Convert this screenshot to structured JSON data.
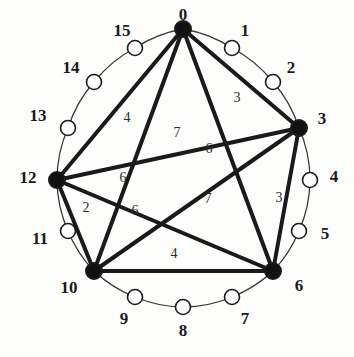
{
  "figure": {
    "colors": {
      "background": "#fdfdfb",
      "edge": "#1a1a1a",
      "arc": "#3a3a3a",
      "filled_node_fill": "#111111",
      "open_node_fill": "#ffffff",
      "node_stroke": "#1a1a1a",
      "label_text": "#1a1a1a",
      "edge_label_text": "#2b2b2b"
    },
    "geometry": {
      "center_x": 183,
      "center_y": 157,
      "node_radius": 128,
      "label_radius": 163
    }
  },
  "chart_data": {
    "type": "diagram",
    "title": "",
    "node_count": 16,
    "nodes": [
      {
        "id": "0",
        "label": "0",
        "x": 183,
        "y": 29,
        "type": "filled",
        "label_x": 183,
        "label_y": 14
      },
      {
        "id": "1",
        "label": "1",
        "x": 232,
        "y": 48,
        "type": "open",
        "label_x": 245,
        "label_y": 30
      },
      {
        "id": "2",
        "label": "2",
        "x": 273,
        "y": 82,
        "type": "open",
        "label_x": 291,
        "label_y": 67
      },
      {
        "id": "3",
        "label": "3",
        "x": 299,
        "y": 128,
        "type": "filled",
        "label_x": 322,
        "label_y": 118
      },
      {
        "id": "4",
        "label": "4",
        "x": 310,
        "y": 180,
        "type": "open",
        "label_x": 334,
        "label_y": 176
      },
      {
        "id": "5",
        "label": "5",
        "x": 299,
        "y": 231,
        "type": "open",
        "label_x": 325,
        "label_y": 233
      },
      {
        "id": "6",
        "label": "6",
        "x": 273,
        "y": 271,
        "type": "filled",
        "label_x": 299,
        "label_y": 285
      },
      {
        "id": "7",
        "label": "7",
        "x": 232,
        "y": 297,
        "type": "open",
        "label_x": 245,
        "label_y": 318
      },
      {
        "id": "8",
        "label": "8",
        "x": 183,
        "y": 307,
        "type": "open",
        "label_x": 183,
        "label_y": 330
      },
      {
        "id": "9",
        "label": "9",
        "x": 135,
        "y": 297,
        "type": "open",
        "label_x": 124,
        "label_y": 318
      },
      {
        "id": "10",
        "label": "10",
        "x": 94,
        "y": 271,
        "type": "filled",
        "label_x": 69,
        "label_y": 287
      },
      {
        "id": "11",
        "label": "11",
        "x": 68,
        "y": 231,
        "type": "open",
        "label_x": 40,
        "label_y": 238
      },
      {
        "id": "12",
        "label": "12",
        "x": 57,
        "y": 180,
        "type": "filled",
        "label_x": 28,
        "label_y": 177
      },
      {
        "id": "13",
        "label": "13",
        "x": 68,
        "y": 128,
        "type": "open",
        "label_x": 38,
        "label_y": 115
      },
      {
        "id": "14",
        "label": "14",
        "x": 94,
        "y": 82,
        "type": "open",
        "label_x": 71,
        "label_y": 67
      },
      {
        "id": "15",
        "label": "15",
        "x": 135,
        "y": 48,
        "type": "open",
        "label_x": 122,
        "label_y": 30
      }
    ],
    "edges": [
      {
        "from": "0",
        "to": "3",
        "weight": "3",
        "label_x": 237,
        "label_y": 98
      },
      {
        "from": "3",
        "to": "6",
        "weight": "3",
        "label_x": 279,
        "label_y": 198
      },
      {
        "from": "6",
        "to": "10",
        "weight": "4",
        "label_x": 174,
        "label_y": 254
      },
      {
        "from": "10",
        "to": "12",
        "weight": "2",
        "label_x": 86,
        "label_y": 208
      },
      {
        "from": "12",
        "to": "0",
        "weight": "4",
        "label_x": 127,
        "label_y": 118
      },
      {
        "from": "0",
        "to": "6",
        "weight": "6",
        "label_x": 209,
        "label_y": 149
      },
      {
        "from": "0",
        "to": "10",
        "weight": "6",
        "label_x": 123,
        "label_y": 178
      },
      {
        "from": "3",
        "to": "10",
        "weight": "7",
        "label_x": 208,
        "label_y": 199
      },
      {
        "from": "3",
        "to": "12",
        "weight": "7",
        "label_x": 177,
        "label_y": 133
      },
      {
        "from": "6",
        "to": "12",
        "weight": "6",
        "label_x": 135,
        "label_y": 211
      }
    ],
    "arcs": [
      [
        "0",
        "1"
      ],
      [
        "1",
        "2"
      ],
      [
        "2",
        "3"
      ],
      [
        "3",
        "4"
      ],
      [
        "4",
        "5"
      ],
      [
        "5",
        "6"
      ],
      [
        "6",
        "7"
      ],
      [
        "7",
        "8"
      ],
      [
        "8",
        "9"
      ],
      [
        "9",
        "10"
      ],
      [
        "10",
        "11"
      ],
      [
        "11",
        "12"
      ],
      [
        "12",
        "13"
      ],
      [
        "13",
        "14"
      ],
      [
        "14",
        "15"
      ],
      [
        "15",
        "0"
      ]
    ],
    "legend": [],
    "xlabel": "",
    "ylabel": ""
  }
}
